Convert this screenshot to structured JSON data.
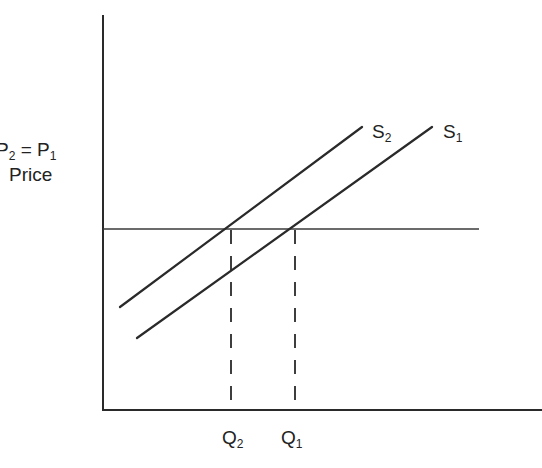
{
  "chart_data": {
    "type": "line",
    "title": "",
    "xlabel": "",
    "ylabel": "Price",
    "price_label": {
      "text": "P",
      "sub2": "2",
      "eq": " = ",
      "text_b": "P",
      "sub1": "1",
      "full": "P2 = P1"
    },
    "grid": false,
    "series": [
      {
        "name": "S1",
        "label": "S",
        "subscript": "1",
        "kind": "supply curve",
        "points": [
          [
            137,
            338
          ],
          [
            432,
            127
          ]
        ]
      },
      {
        "name": "S2",
        "label": "S",
        "subscript": "2",
        "kind": "supply curve (shifted left)",
        "points": [
          [
            120,
            307
          ],
          [
            362,
            127
          ]
        ]
      },
      {
        "name": "P2 = P1",
        "kind": "horizontal price line",
        "points": [
          [
            103,
            229
          ],
          [
            479,
            229
          ]
        ]
      }
    ],
    "x_markers": [
      {
        "name": "Q2",
        "label": "Q",
        "subscript": "2",
        "x": 231
      },
      {
        "name": "Q1",
        "label": "Q",
        "subscript": "1",
        "x": 295
      }
    ],
    "annotations": [
      "Q2 is where S2 intersects the price line",
      "Q1 is where S1 intersects the price line",
      "Dashed vertical lines drop from the intersections to the quantity axis"
    ]
  },
  "labels": {
    "price_top": {
      "p2": "P",
      "p2_sub": "2",
      "equals": " = ",
      "p1": "P",
      "p1_sub": "1"
    },
    "price_axis": "Price",
    "s2": {
      "base": "S",
      "sub": "2"
    },
    "s1": {
      "base": "S",
      "sub": "1"
    },
    "q2": {
      "base": "Q",
      "sub": "2"
    },
    "q1": {
      "base": "Q",
      "sub": "1"
    }
  },
  "colors": {
    "line": "#2a2a2a",
    "text": "#222222",
    "background": "#ffffff"
  }
}
